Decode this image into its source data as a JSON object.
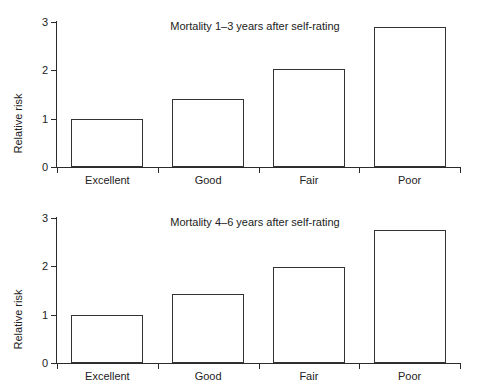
{
  "figure": {
    "width": 480,
    "height": 392,
    "background": "#ffffff",
    "line_color": "#333333",
    "text_color": "#222222"
  },
  "chart_data": [
    {
      "type": "bar",
      "title": "Mortality 1–3 years after self-rating",
      "xlabel": "",
      "ylabel": "Relative risk",
      "categories": [
        "Excellent",
        "Good",
        "Fair",
        "Poor"
      ],
      "values": [
        1.0,
        1.4,
        2.03,
        2.9
      ],
      "ylim": [
        0,
        3
      ],
      "yticks": [
        0,
        1,
        2,
        3
      ],
      "ytick_labels": [
        "0",
        "1",
        "2",
        "3"
      ],
      "grid": false,
      "legend": "none",
      "bar_fill": "#ffffff",
      "bar_edge": "#333333"
    },
    {
      "type": "bar",
      "title": "Mortality 4–6 years after self-rating",
      "xlabel": "",
      "ylabel": "Relative risk",
      "categories": [
        "Excellent",
        "Good",
        "Fair",
        "Poor"
      ],
      "values": [
        1.0,
        1.43,
        1.98,
        2.76
      ],
      "ylim": [
        0,
        3
      ],
      "yticks": [
        0,
        1,
        2,
        3
      ],
      "ytick_labels": [
        "0",
        "1",
        "2",
        "3"
      ],
      "grid": false,
      "legend": "none",
      "bar_fill": "#ffffff",
      "bar_edge": "#333333"
    }
  ]
}
